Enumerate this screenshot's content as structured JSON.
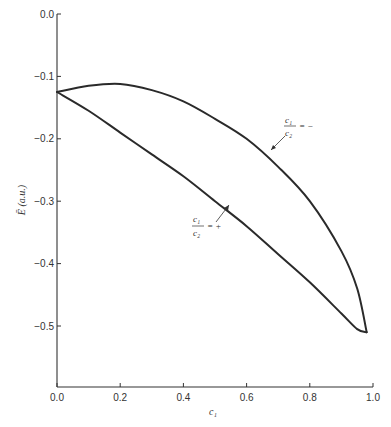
{
  "chart_data": {
    "type": "line",
    "title": "",
    "xlabel": "c₁",
    "ylabel": "Ē (a.u.)",
    "xlim": [
      0.0,
      1.0
    ],
    "ylim": [
      -0.6,
      0.0
    ],
    "x_ticks": [
      "0.0",
      "0.2",
      "0.4",
      "0.6",
      "0.8",
      "1.0"
    ],
    "y_ticks": [
      "0.0",
      "−0.1",
      "−0.2",
      "−0.3",
      "−0.4",
      "−0.5"
    ],
    "grid": false,
    "legend": "none (inline annotations)",
    "series": [
      {
        "name": "c1/c2 = −",
        "x": [
          0.0,
          0.1,
          0.2,
          0.3,
          0.4,
          0.5,
          0.6,
          0.7,
          0.8,
          0.9,
          0.95,
          0.98
        ],
        "y": [
          -0.125,
          -0.115,
          -0.112,
          -0.122,
          -0.14,
          -0.168,
          -0.2,
          -0.245,
          -0.3,
          -0.38,
          -0.44,
          -0.51
        ]
      },
      {
        "name": "c1/c2 = +",
        "x": [
          0.0,
          0.1,
          0.2,
          0.3,
          0.4,
          0.5,
          0.6,
          0.7,
          0.8,
          0.9,
          0.95,
          0.98
        ],
        "y": [
          -0.125,
          -0.155,
          -0.19,
          -0.225,
          -0.26,
          -0.3,
          -0.34,
          -0.385,
          -0.43,
          -0.48,
          -0.505,
          -0.51
        ]
      }
    ],
    "annotations": [
      {
        "text_num": "c1",
        "text_den": "c2",
        "sign": "= −",
        "series": "c1/c2 = −"
      },
      {
        "text_num": "c1",
        "text_den": "c2",
        "sign": "= +",
        "series": "c1/c2 = +"
      }
    ]
  },
  "labels": {
    "xlabel": "c₁",
    "ylabel": "Ē (a.u.)",
    "ann_minus_num": "c₁",
    "ann_minus_den": "c₂",
    "ann_minus_sign": "= −",
    "ann_plus_num": "c₁",
    "ann_plus_den": "c₂",
    "ann_plus_sign": "= +"
  }
}
